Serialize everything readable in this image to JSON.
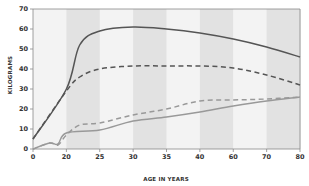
{
  "chart_data": {
    "type": "line",
    "title": "",
    "xlabel": "AGE IN YEARS",
    "ylabel": "KILOGRAMS",
    "x_ticks": [
      "0",
      "20",
      "25",
      "30",
      "35",
      "40",
      "60",
      "70",
      "80"
    ],
    "x_scale": "categorical-equal-spacing",
    "y_ticks": [
      0,
      10,
      20,
      30,
      40,
      50,
      60,
      70
    ],
    "ylim": [
      0,
      70
    ],
    "grid": false,
    "background_bands": "alternating light/dark gray vertical bands between x ticks",
    "legend": "none",
    "series": [
      {
        "name": "dark-solid",
        "style": "solid",
        "color": "#555555",
        "points": [
          [
            0,
            5
          ],
          [
            20,
            30
          ],
          [
            22,
            52
          ],
          [
            25,
            59
          ],
          [
            30,
            61
          ],
          [
            35,
            60
          ],
          [
            40,
            58
          ],
          [
            60,
            55
          ],
          [
            70,
            51
          ],
          [
            80,
            46
          ]
        ]
      },
      {
        "name": "dark-dashed",
        "style": "dashed",
        "color": "#555555",
        "points": [
          [
            0,
            5
          ],
          [
            20,
            29
          ],
          [
            22,
            36
          ],
          [
            25,
            40
          ],
          [
            30,
            41.5
          ],
          [
            35,
            41.5
          ],
          [
            40,
            41.5
          ],
          [
            60,
            40.5
          ],
          [
            70,
            37
          ],
          [
            80,
            32
          ]
        ]
      },
      {
        "name": "light-dashed",
        "style": "dashed",
        "color": "#999999",
        "points": [
          [
            0,
            0
          ],
          [
            10,
            3
          ],
          [
            15,
            2
          ],
          [
            20,
            7
          ],
          [
            22,
            12
          ],
          [
            25,
            13
          ],
          [
            30,
            17
          ],
          [
            35,
            20
          ],
          [
            40,
            24
          ],
          [
            60,
            24.5
          ],
          [
            70,
            25
          ],
          [
            80,
            26
          ]
        ]
      },
      {
        "name": "light-solid",
        "style": "solid",
        "color": "#999999",
        "points": [
          [
            0,
            0
          ],
          [
            10,
            3
          ],
          [
            15,
            2.5
          ],
          [
            20,
            8
          ],
          [
            25,
            9.5
          ],
          [
            30,
            14
          ],
          [
            35,
            16
          ],
          [
            40,
            18.5
          ],
          [
            60,
            21.5
          ],
          [
            70,
            24
          ],
          [
            80,
            26
          ]
        ]
      }
    ]
  },
  "colors": {
    "band_light": "#f3f3f3",
    "band_dark": "#e2e2e2",
    "axis": "#888888",
    "dark_line": "#555555",
    "light_line": "#9a9a9a"
  }
}
